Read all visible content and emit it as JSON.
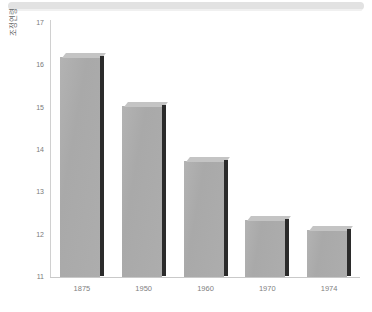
{
  "chart_data": {
    "type": "bar",
    "title": "",
    "xlabel": "",
    "ylabel": "조정연령",
    "categories": [
      "1875",
      "1950",
      "1960",
      "1970",
      "1974"
    ],
    "values": [
      16.2,
      15.05,
      13.75,
      12.35,
      12.1
    ],
    "ylim": [
      11,
      17
    ],
    "yticks": [
      "11",
      "12",
      "13",
      "14",
      "15",
      "16",
      "17"
    ],
    "grid": false,
    "legend": null,
    "bar_color": "#ababab",
    "bar_top_color": "#c4c4c4",
    "bar_side_color": "#2b2b2b",
    "axis_color": "#c9c9c9",
    "tick_label_color": "#7a7a7a"
  },
  "header": {
    "band_color": "#e2e2e2"
  }
}
